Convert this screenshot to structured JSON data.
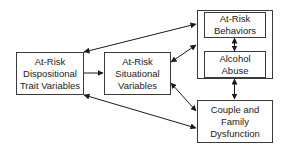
{
  "diagram": {
    "nodes": {
      "dispositional": {
        "lines": [
          "At-Risk",
          "Dispositional",
          "Trait Variables"
        ]
      },
      "situational": {
        "lines": [
          "At-Risk",
          "Situational",
          "Variables"
        ]
      },
      "behaviors": {
        "lines": [
          "At-Risk",
          "Behaviors"
        ]
      },
      "alcohol": {
        "lines": [
          "Alcohol",
          "Abuse"
        ]
      },
      "couple": {
        "lines": [
          "Couple and",
          "Family",
          "Dysfunction"
        ]
      }
    },
    "edges": [
      {
        "from": "dispositional",
        "to": "behaviors-group",
        "direction": "bidirectional"
      },
      {
        "from": "dispositional",
        "to": "situational",
        "direction": "forward"
      },
      {
        "from": "dispositional",
        "to": "couple",
        "direction": "bidirectional"
      },
      {
        "from": "situational",
        "to": "behaviors-group",
        "direction": "bidirectional"
      },
      {
        "from": "situational",
        "to": "couple",
        "direction": "bidirectional"
      },
      {
        "from": "behaviors",
        "to": "alcohol",
        "direction": "bidirectional"
      },
      {
        "from": "behaviors-group",
        "to": "couple",
        "direction": "bidirectional"
      }
    ],
    "colors": {
      "line": "#1a1a1a",
      "border": "#3a3a3a",
      "background": "#ffffff"
    }
  }
}
